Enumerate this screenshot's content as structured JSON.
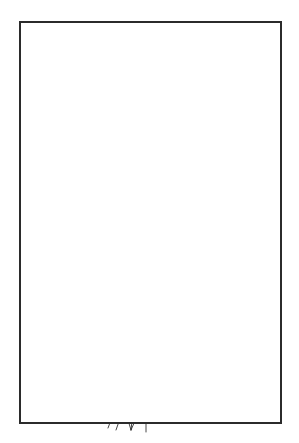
{
  "figure": {
    "domain": "medical-line-drawing",
    "caption": "",
    "background_color": "#ffffff",
    "ink_color": "#1a1a1a",
    "frame": {
      "label": "illustration-border",
      "x": 19,
      "y": 21,
      "width": 263,
      "height": 403,
      "stroke_color": "#2b2b2b",
      "stroke_width": 2
    },
    "canvas": {
      "width": 299,
      "height": 443
    },
    "structures": [
      {
        "id": "gallbladder",
        "label": "Gallbladder",
        "description": "Rounded pear-shaped organ at upper left, drawn with double contour lines",
        "stroke_color": "#1a1a1a"
      },
      {
        "id": "gallbladder-neck",
        "label": "Gallbladder neck with Hartmann pouch",
        "description": "Narrowing with small shaded bulge at lower left of gallbladder",
        "stroke_color": "#1a1a1a",
        "shade_color": "#bdbdbd"
      },
      {
        "id": "cystic-duct",
        "label": "Cystic duct",
        "description": "Duct descending from gallbladder neck, crossing the hepatic duct",
        "stroke_color": "#1a1a1a"
      },
      {
        "id": "hepatic-duct",
        "label": "Common hepatic duct",
        "description": "Duct running from upper right downward to the left, crossing the cystic duct",
        "stroke_color": "#1a1a1a"
      },
      {
        "id": "branch-ducts-upper-right",
        "label": "Intrahepatic duct branches",
        "description": "Small side branches with forked tips at upper right",
        "stroke_color": "#1a1a1a"
      },
      {
        "id": "pancreatic-duct",
        "label": "Pancreatic duct branches",
        "description": "Branching forked ducts at mid right with small shaded segment",
        "stroke_color": "#1a1a1a",
        "shade_color": "#c8c8c8"
      },
      {
        "id": "common-bile-duct",
        "label": "Common bile duct",
        "description": "Long descending duct from crossing point down to the duodenal bulb",
        "stroke_color": "#1a1a1a"
      },
      {
        "id": "biliary-stent",
        "label": "Biliary stent",
        "description": "Long ribbed coiled stent running inside the common bile duct, shown with dense transverse rungs",
        "stroke_color": "#1a1a1a",
        "fill_color": "#9a9a9a"
      },
      {
        "id": "left-vessel",
        "label": "Accessory vessel / duct",
        "description": "Thin forked line at mid left running parallel to the bile duct",
        "stroke_color": "#1a1a1a"
      },
      {
        "id": "duodenal-bulb",
        "label": "Duodenal bulb / ampulla of Vater",
        "description": "Densely cross-hatched sphere at the bottom where the stent exits through the papilla",
        "stroke_color": "#1a1a1a",
        "hatch_color": "#333333"
      },
      {
        "id": "distal-vessels",
        "label": "Distal ducts / vessels",
        "description": "Three to four thin lines trailing below the duodenal bulb",
        "stroke_color": "#1a1a1a"
      }
    ]
  }
}
